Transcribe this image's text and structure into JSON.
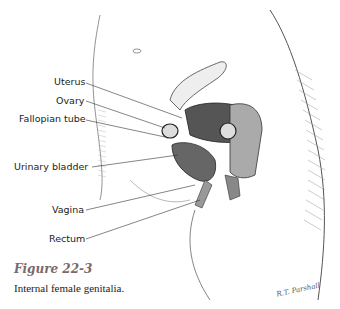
{
  "figure": {
    "title": "Figure 22-3",
    "caption": "Internal female genitalia.",
    "signature": "R.T. Parshall"
  },
  "labels": [
    {
      "id": "uterus",
      "text": "Uterus"
    },
    {
      "id": "ovary",
      "text": "Ovary"
    },
    {
      "id": "fallopian-tube",
      "text": "Fallopian tube"
    },
    {
      "id": "urinary-bladder",
      "text": "Urinary bladder"
    },
    {
      "id": "vagina",
      "text": "Vagina"
    },
    {
      "id": "rectum",
      "text": "Rectum"
    }
  ],
  "colors": {
    "line": "#333333",
    "title": "#7a6a6a"
  }
}
